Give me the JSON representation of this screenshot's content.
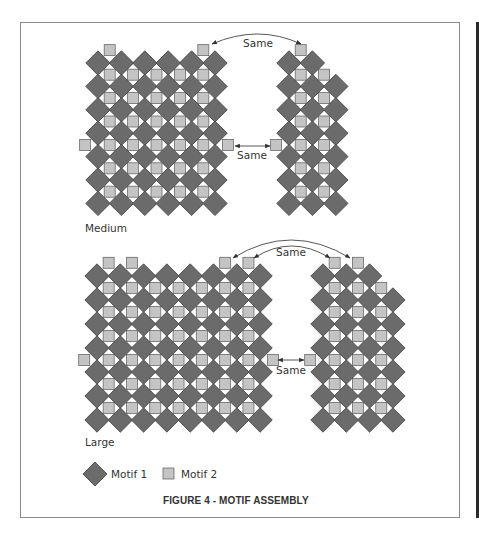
{
  "figure": {
    "caption": "FIGURE 4 - MOTIF ASSEMBLY",
    "colors": {
      "motif1": "#6b6b6b",
      "motif2": "#c4c4c4",
      "frame": "#8a8a8a",
      "text": "#333333"
    }
  },
  "sections": [
    {
      "label": "Medium",
      "label_pos": [
        85,
        228
      ]
    },
    {
      "label": "Large",
      "label_pos": [
        85,
        444
      ]
    }
  ],
  "legend": [
    {
      "shape": "diamond",
      "label": "Motif 1"
    },
    {
      "shape": "square",
      "label": "Motif 2"
    }
  ],
  "annotations": {
    "same_label": "Same",
    "medium_top": {
      "label": "Same"
    },
    "medium_side": {
      "label": "Same"
    },
    "large_top": {
      "label": "Same"
    },
    "large_side": {
      "label": "Same"
    }
  },
  "grids": [
    {
      "name": "medium-left",
      "x0": 98,
      "y0": 63,
      "dx": 23.4,
      "dy": 23.4,
      "cols": 6,
      "rows": 7,
      "row_cols": [
        6,
        6,
        6,
        6,
        6,
        6,
        6
      ],
      "top_squares": [
        0,
        4
      ],
      "side_squares": {
        "row_gap": 3,
        "left": true,
        "right": true
      }
    },
    {
      "name": "medium-right",
      "x0": 289,
      "y0": 63,
      "dx": 23.4,
      "dy": 23.4,
      "cols": 3,
      "rows": 7,
      "row_cols": [
        2,
        3,
        3,
        3,
        3,
        3,
        3
      ],
      "top_squares": [
        0
      ],
      "side_squares": {
        "row_gap": 3,
        "left": true,
        "right": false
      }
    },
    {
      "name": "large-left",
      "x0": 97,
      "y0": 276,
      "dx": 23.3,
      "dy": 24.0,
      "cols": 8,
      "rows": 7,
      "row_cols": [
        8,
        8,
        8,
        8,
        8,
        8,
        8
      ],
      "top_squares": [
        0,
        1,
        5,
        6
      ],
      "side_squares": {
        "row_gap": 3,
        "left": true,
        "right": true
      }
    },
    {
      "name": "large-right",
      "x0": 323,
      "y0": 276,
      "dx": 23.3,
      "dy": 24.0,
      "cols": 4,
      "rows": 7,
      "row_cols": [
        3,
        4,
        4,
        4,
        4,
        4,
        4
      ],
      "top_squares": [
        0,
        1
      ],
      "side_squares": {
        "row_gap": 3,
        "left": true,
        "right": false
      }
    }
  ]
}
